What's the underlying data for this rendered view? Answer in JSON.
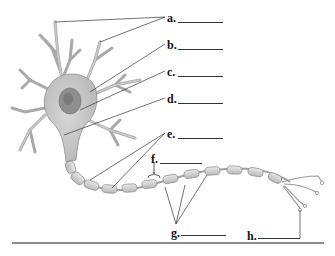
{
  "diagram": {
    "labels": [
      {
        "key": "a",
        "text": "a.",
        "x": 167,
        "y": 12,
        "blank_x": 178,
        "blank_w": 45,
        "targets": [
          [
            55,
            22
          ],
          [
            100,
            42
          ]
        ]
      },
      {
        "key": "b",
        "text": "b.",
        "x": 167,
        "y": 39,
        "blank_x": 178,
        "blank_w": 45,
        "targets": [
          [
            90,
            92
          ]
        ]
      },
      {
        "key": "c",
        "text": "c.",
        "x": 167,
        "y": 66,
        "blank_x": 178,
        "blank_w": 45,
        "targets": [
          [
            80,
            110
          ]
        ]
      },
      {
        "key": "d",
        "text": "d.",
        "x": 167,
        "y": 93,
        "blank_x": 178,
        "blank_w": 45,
        "targets": [
          [
            64,
            135
          ]
        ]
      },
      {
        "key": "e",
        "text": "e.",
        "x": 167,
        "y": 128,
        "blank_x": 178,
        "blank_w": 45,
        "targets": [
          [
            90,
            180
          ],
          [
            112,
            188
          ]
        ]
      },
      {
        "key": "f",
        "text": "f.",
        "x": 151,
        "y": 153,
        "blank_x": 160,
        "blank_w": 42,
        "targets": [
          [
            153,
            175
          ]
        ]
      },
      {
        "key": "g",
        "text": "g.",
        "x": 171,
        "y": 229,
        "blank_x": 181,
        "blank_w": 45,
        "targets": [
          [
            165,
            187
          ],
          [
            185,
            185
          ],
          [
            207,
            175
          ]
        ]
      },
      {
        "key": "h",
        "text": "h.",
        "x": 247,
        "y": 232,
        "blank_x": 258,
        "blank_w": 42,
        "targets": [
          [
            300,
            210
          ]
        ]
      }
    ],
    "colors": {
      "cell_fill": "#cfcfcf",
      "cell_stroke": "#8f8f8f",
      "nucleus_fill": "#8e8e8e",
      "myelin_fill": "#d7d7d7",
      "leader_line": "#333333",
      "rule": "#8a8a8a"
    }
  }
}
